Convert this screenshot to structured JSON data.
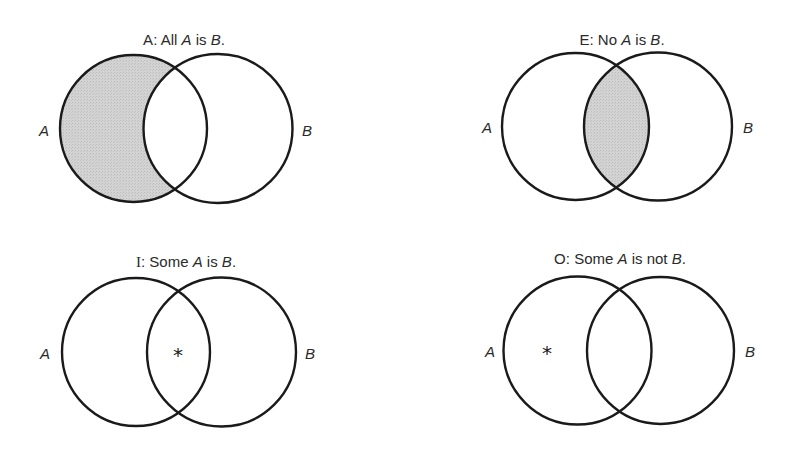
{
  "figure": {
    "shade_color": "#cfcfcf",
    "stroke_color": "#1a1a1a",
    "text_color": "#2a2a2a",
    "marker_glyph": "∗"
  },
  "diagrams": [
    {
      "id": "A",
      "title": {
        "letter": "A",
        "sep": ":",
        "pre": "All",
        "var1": "A",
        "mid": "is",
        "var2": "B",
        "end": "."
      },
      "full_title": "A: All A is B.",
      "labels": {
        "left": "A",
        "right": "B"
      },
      "shaded_region": "A-only",
      "marker_region": null
    },
    {
      "id": "E",
      "title": {
        "letter": "E",
        "sep": ":",
        "pre": "No",
        "var1": "A",
        "mid": "is",
        "var2": "B",
        "end": "."
      },
      "full_title": "E: No A is B.",
      "labels": {
        "left": "A",
        "right": "B"
      },
      "shaded_region": "A-and-B",
      "marker_region": null
    },
    {
      "id": "I",
      "title": {
        "letter": "I",
        "sep": ":",
        "pre": "Some",
        "var1": "A",
        "mid": "is",
        "var2": "B",
        "end": "."
      },
      "full_title": "I: Some A is B.",
      "labels": {
        "left": "A",
        "right": "B"
      },
      "shaded_region": null,
      "marker_region": "A-and-B",
      "marker": "*"
    },
    {
      "id": "O",
      "title": {
        "letter": "O",
        "sep": ":",
        "pre": "Some",
        "var1": "A",
        "mid": "is not",
        "var2": "B",
        "end": "."
      },
      "full_title": "O: Some A is not B.",
      "labels": {
        "left": "A",
        "right": "B"
      },
      "shaded_region": null,
      "marker_region": "A-only",
      "marker": "*"
    }
  ]
}
